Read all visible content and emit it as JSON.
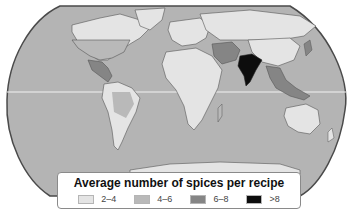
{
  "map": {
    "title": "Average number of spices per recipe",
    "projection": "robinson-like world map",
    "colors": {
      "ocean": "#b4b4b4",
      "equator_line": "#f2f2f2",
      "outline": "#4a4a4a"
    },
    "legend": {
      "title": "Average number of spices per recipe",
      "items": [
        {
          "label": "2–4",
          "color": "#e4e4e4"
        },
        {
          "label": "4–6",
          "color": "#b9b9b9"
        },
        {
          "label": "6–8",
          "color": "#858585"
        },
        {
          "label": ">8",
          "color": "#0d0d0d"
        }
      ]
    },
    "regions": [
      {
        "name": "North America (Canada, USA)",
        "class": "2–4"
      },
      {
        "name": "Greenland",
        "class": "2–4"
      },
      {
        "name": "Mexico & Central America",
        "class": "6–8"
      },
      {
        "name": "South America",
        "class": "2–4"
      },
      {
        "name": "Europe",
        "class": "2–4"
      },
      {
        "name": "Africa",
        "class": "2–4"
      },
      {
        "name": "Middle East",
        "class": "6–8"
      },
      {
        "name": "Russia / Northern Asia",
        "class": "2–4"
      },
      {
        "name": "China",
        "class": "2–4"
      },
      {
        "name": "India",
        "class": ">8"
      },
      {
        "name": "Southeast Asia",
        "class": "6–8"
      },
      {
        "name": "Australia",
        "class": "2–4"
      },
      {
        "name": "Antarctica",
        "class": "2–4"
      }
    ]
  }
}
